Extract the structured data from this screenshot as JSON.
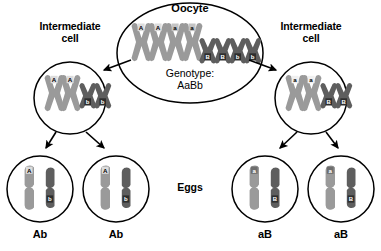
{
  "figure": {
    "title_oocyte": "Oocyte",
    "genotype_label": "Genotype:",
    "genotype_value": "AaBb",
    "eggs_label": "Eggs",
    "intermediate_left": "Intermediate\ncell",
    "intermediate_right": "Intermediate\ncell"
  },
  "colors": {
    "chromosome_light": "#9a9a9a",
    "chromosome_dark": "#5e5e5e",
    "outline": "#000000",
    "background": "#ffffff",
    "allele_box_dark_text": "#ffffff",
    "allele_box_light_text": "#000000"
  },
  "oocyte": {
    "name": "Oocyte",
    "large_chromosomes": [
      {
        "allele": "A",
        "shade": "light"
      },
      {
        "allele": "A",
        "shade": "light"
      },
      {
        "allele": "a",
        "shade": "light"
      },
      {
        "allele": "a",
        "shade": "light"
      }
    ],
    "small_chromosomes": [
      {
        "allele": "B",
        "shade": "dark"
      },
      {
        "allele": "B",
        "shade": "dark"
      },
      {
        "allele": "b",
        "shade": "dark"
      },
      {
        "allele": "b",
        "shade": "dark"
      }
    ]
  },
  "intermediate_cells": [
    {
      "side": "left",
      "label": "Intermediate\ncell",
      "large_chromosomes": [
        {
          "allele": "A",
          "shade": "light"
        },
        {
          "allele": "A",
          "shade": "light"
        }
      ],
      "small_chromosomes": [
        {
          "allele": "b",
          "shade": "dark"
        },
        {
          "allele": "b",
          "shade": "dark"
        }
      ]
    },
    {
      "side": "right",
      "label": "Intermediate\ncell",
      "large_chromosomes": [
        {
          "allele": "a",
          "shade": "light"
        },
        {
          "allele": "a",
          "shade": "light"
        }
      ],
      "small_chromosomes": [
        {
          "allele": "B",
          "shade": "dark"
        },
        {
          "allele": "B",
          "shade": "dark"
        }
      ]
    }
  ],
  "eggs": [
    {
      "genotype": "Ab",
      "large_allele": "A",
      "small_allele": "b"
    },
    {
      "genotype": "Ab",
      "large_allele": "A",
      "small_allele": "b"
    },
    {
      "genotype": "aB",
      "large_allele": "a",
      "small_allele": "B"
    },
    {
      "genotype": "aB",
      "large_allele": "a",
      "small_allele": "B"
    }
  ]
}
